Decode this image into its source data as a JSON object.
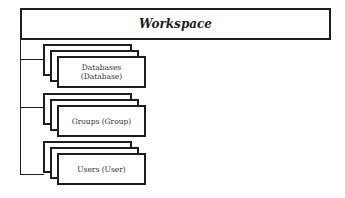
{
  "root": {
    "label": "Workspace"
  },
  "children": [
    {
      "label_line1": "Databases",
      "label_line2": "(Database)"
    },
    {
      "label_line1": "Groups (Group)",
      "label_line2": ""
    },
    {
      "label_line1": "Users (User)",
      "label_line2": ""
    }
  ],
  "colors": {
    "line": "#1e1e1e",
    "background": "#ffffff"
  }
}
